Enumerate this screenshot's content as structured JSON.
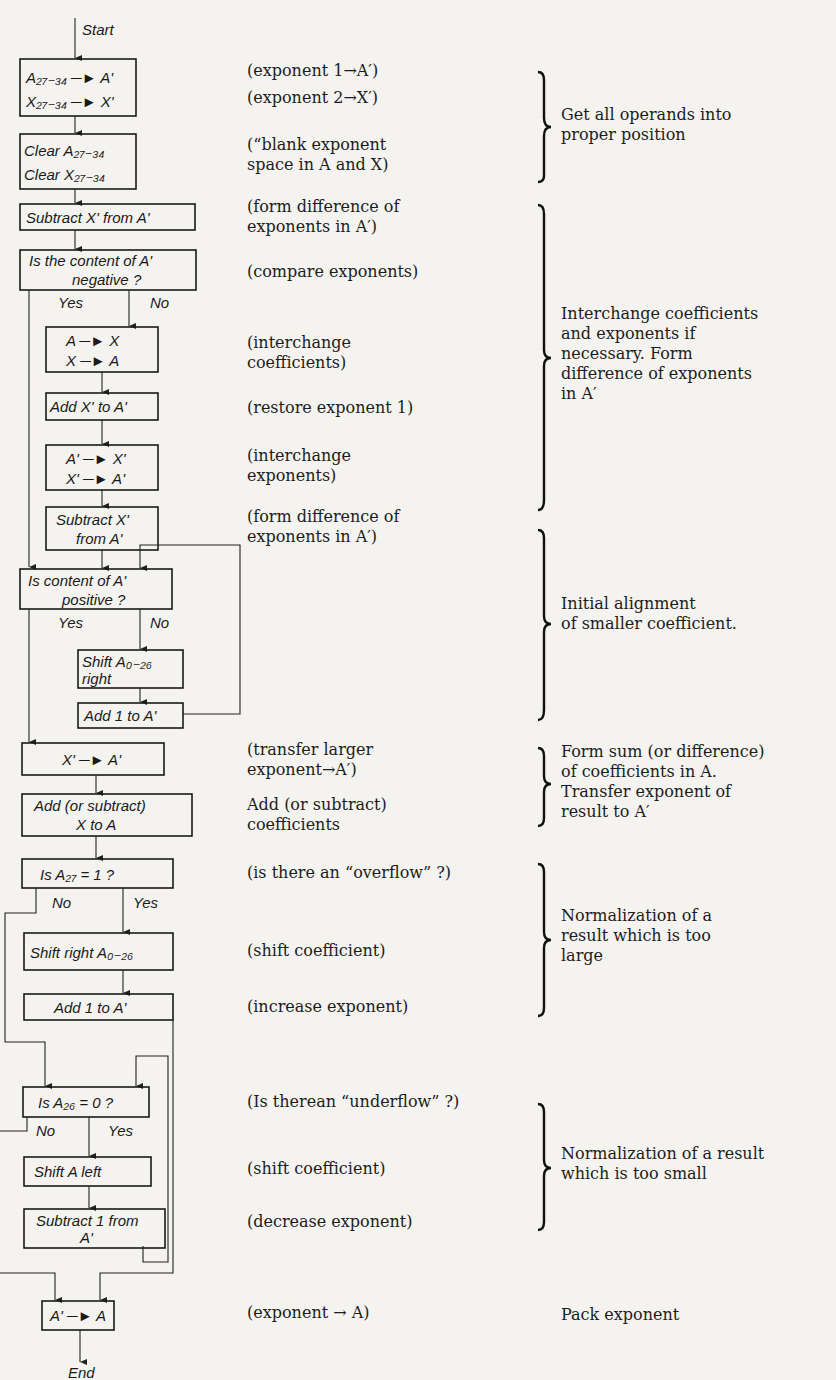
{
  "diagram": {
    "start_label": "Start",
    "end_label": "End",
    "boxes": [
      {
        "id": "b1",
        "lines": [
          "A₂₇₋₃₄ ─► A'",
          "X₂₇₋₃₄ ─► X'"
        ]
      },
      {
        "id": "b2",
        "lines": [
          "Clear A₂₇₋₃₄",
          "Clear X₂₇₋₃₄"
        ]
      },
      {
        "id": "b3",
        "lines": [
          "Subtract X' from A'"
        ]
      },
      {
        "id": "b4",
        "lines": [
          "Is the content of A'",
          "negative ?"
        ]
      },
      {
        "id": "b5",
        "lines": [
          "A ─► X",
          "X ─► A"
        ]
      },
      {
        "id": "b6",
        "lines": [
          "Add X' to A'"
        ]
      },
      {
        "id": "b7",
        "lines": [
          "A' ─► X'",
          "X' ─► A'"
        ]
      },
      {
        "id": "b8",
        "lines": [
          "Subtract X'",
          "from A'"
        ]
      },
      {
        "id": "b9",
        "lines": [
          "Is content of A'",
          "positive ?"
        ]
      },
      {
        "id": "b10",
        "lines": [
          "Shift A₀₋₂₆",
          "right"
        ]
      },
      {
        "id": "b11",
        "lines": [
          "Add 1 to A'"
        ]
      },
      {
        "id": "b12",
        "lines": [
          "X' ─► A'"
        ]
      },
      {
        "id": "b13",
        "lines": [
          "Add (or subtract)",
          "X to A"
        ]
      },
      {
        "id": "b14",
        "lines": [
          "Is A₂₇ = 1 ?"
        ]
      },
      {
        "id": "b15",
        "lines": [
          "Shift right A₀₋₂₆"
        ]
      },
      {
        "id": "b16",
        "lines": [
          "Add 1 to A'"
        ]
      },
      {
        "id": "b17",
        "lines": [
          "Is A₂₆ = 0 ?"
        ]
      },
      {
        "id": "b18",
        "lines": [
          "Shift A left"
        ]
      },
      {
        "id": "b19",
        "lines": [
          "Subtract 1 from",
          "A'"
        ]
      },
      {
        "id": "b20",
        "lines": [
          "A' ─► A"
        ]
      }
    ],
    "branch_labels": {
      "b4_yes": "Yes",
      "b4_no": "No",
      "b9_yes": "Yes",
      "b9_no": "No",
      "b14_no": "No",
      "b14_yes": "Yes",
      "b17_no": "No",
      "b17_yes": "Yes"
    }
  },
  "comments": [
    "(exponent 1→A′)",
    "(exponent 2→X′)",
    "(“blank exponent\nspace in A and X)",
    "(form difference of\nexponents in A′)",
    "(compare exponents)",
    "(interchange\ncoefficients)",
    "(restore exponent 1)",
    "(interchange\nexponents)",
    "(form difference of\nexponents in A′)",
    "(transfer larger\nexponent→A′)",
    "Add (or subtract)\ncoefficients",
    "(is there an “overflow” ?)",
    "(shift coefficient)",
    "(increase exponent)",
    "(Is therean “underflow” ?)",
    "(shift coefficient)",
    "(decrease exponent)",
    "(exponent → A)"
  ],
  "descriptions": [
    "Get all operands into\nproper position",
    "Interchange coefficients\nand exponents if\nnecessary. Form\ndifference of exponents\nin A′",
    "Initial alignment\nof smaller coefficient.",
    "Form sum (or difference)\nof coefficients in A.\nTransfer exponent of\nresult to A′",
    "Normalization of a\nresult which is too\nlarge",
    "Normalization of a result\nwhich is too small",
    "Pack exponent"
  ]
}
